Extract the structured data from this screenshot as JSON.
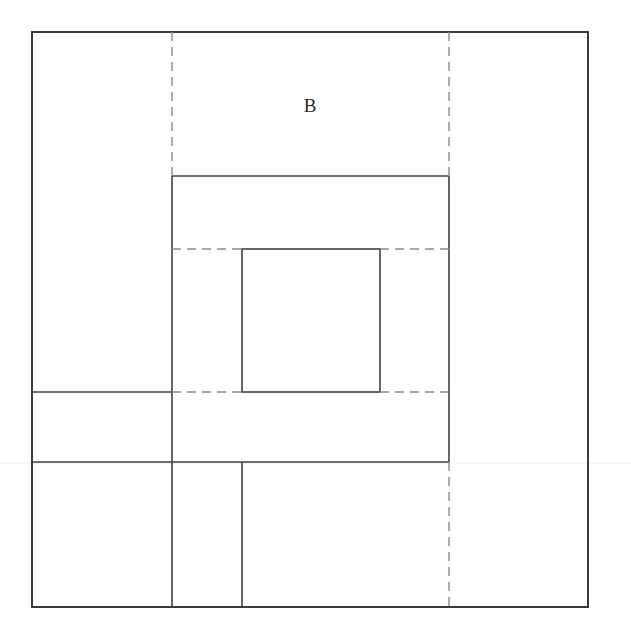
{
  "figure": {
    "canvas": {
      "width": 631,
      "height": 638,
      "background": "#ffffff"
    },
    "colors": {
      "outer_stroke": "#3a3a3a",
      "solid_stroke": "#404040",
      "dashed_stroke": "#8a8a8a",
      "label_color": "#2b2b2b",
      "artifact_color": "#ececec"
    },
    "label": {
      "text": "B",
      "x": 310,
      "y": 112,
      "font_size": 19
    },
    "outer_rect": {
      "x": 32,
      "y": 32,
      "width": 556,
      "height": 575
    },
    "inner_square": {
      "x": 242,
      "y": 249,
      "width": 138,
      "height": 143
    },
    "solid_segments": [
      {
        "x1": 172,
        "y1": 176,
        "x2": 449,
        "y2": 176
      },
      {
        "x1": 172,
        "y1": 176,
        "x2": 172,
        "y2": 607
      },
      {
        "x1": 449,
        "y1": 176,
        "x2": 449,
        "y2": 462
      },
      {
        "x1": 32,
        "y1": 462,
        "x2": 449,
        "y2": 462
      },
      {
        "x1": 32,
        "y1": 392,
        "x2": 172,
        "y2": 392
      },
      {
        "x1": 242,
        "y1": 462,
        "x2": 242,
        "y2": 607
      }
    ],
    "dashed_segments": [
      {
        "x1": 172,
        "y1": 32,
        "x2": 172,
        "y2": 176
      },
      {
        "x1": 449,
        "y1": 32,
        "x2": 449,
        "y2": 176
      },
      {
        "x1": 449,
        "y1": 462,
        "x2": 449,
        "y2": 607
      },
      {
        "x1": 172,
        "y1": 249,
        "x2": 242,
        "y2": 249
      },
      {
        "x1": 380,
        "y1": 249,
        "x2": 449,
        "y2": 249
      },
      {
        "x1": 172,
        "y1": 392,
        "x2": 242,
        "y2": 392
      },
      {
        "x1": 380,
        "y1": 392,
        "x2": 449,
        "y2": 392
      }
    ],
    "artifact_line": {
      "y": 463
    },
    "stroke_widths": {
      "outer": 2,
      "solid": 1.6,
      "dashed": 1.4
    },
    "dash_pattern": "9 6"
  }
}
